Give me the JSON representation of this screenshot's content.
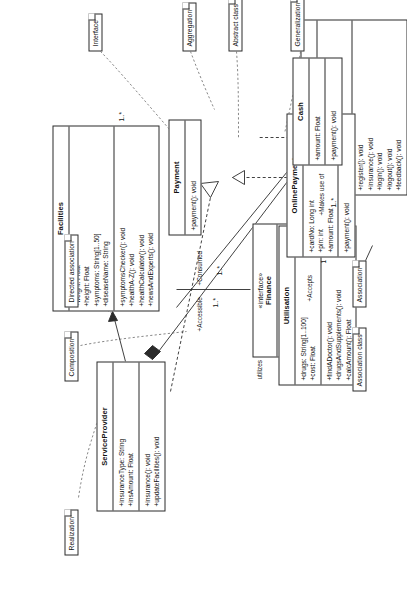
{
  "diagram": {
    "orientation": "rotated-90"
  },
  "classes": [
    {
      "id": "serviceprovider",
      "name": "ServiceProvider",
      "stereotype": "",
      "attributes": [
        "+insuranceType: String",
        "+insAmount: Float"
      ],
      "methods": [
        "+insurance(): void",
        "+updateFacilities(): void"
      ]
    },
    {
      "id": "facilities",
      "name": "Facilities",
      "stereotype": "",
      "attributes": [
        "+weight: Float",
        "+height: Float",
        "+symptoms: String[1..50]",
        "+diseaseName: String"
      ],
      "methods": [
        "+symptomsChecker(): void",
        "+healthA-Z(): void",
        "+healthCalculator(): void",
        "+newsAndExperts(): void"
      ]
    },
    {
      "id": "finance",
      "name": "Finance",
      "stereotype": "«interface»",
      "attributes": [],
      "methods": [
        "+insurance(): void"
      ]
    },
    {
      "id": "utilisation",
      "name": "Utilisation",
      "stereotype": "",
      "attributes": [
        "+drugs: String[1..100]",
        "+cost: Float"
      ],
      "methods": [
        "+findADoctor(): void",
        "+drugsAndSupplements(): void",
        "+calcAmount(): Float"
      ]
    },
    {
      "id": "user",
      "name": "User",
      "stereotype": "",
      "attributes": [
        "+name: String",
        "+id: int",
        "+password: String"
      ],
      "methods": [
        "+register(): void",
        "+insurance(): void",
        "+login(): void",
        "+logout(): void",
        "+feedback(): void"
      ]
    },
    {
      "id": "payment",
      "name": "Payment",
      "stereotype": "",
      "attributes": [],
      "methods": [
        "+payment(): void"
      ]
    },
    {
      "id": "onlinepayment",
      "name": "OnlinePayment",
      "stereotype": "",
      "attributes": [
        "+cardNo: Long int",
        "+pin: int",
        "+amount: Float"
      ],
      "methods": [
        "+payment(): void"
      ]
    },
    {
      "id": "cash",
      "name": "Cash",
      "stereotype": "",
      "attributes": [
        "+amount: Float"
      ],
      "methods": [
        "+payment(): void"
      ]
    }
  ],
  "notes": [
    {
      "id": "realization",
      "label": "Realization"
    },
    {
      "id": "composition",
      "label": "Composition"
    },
    {
      "id": "directed-association",
      "label": "Directed association"
    },
    {
      "id": "association",
      "label": "Association"
    },
    {
      "id": "association-class",
      "label": "Association class"
    },
    {
      "id": "interface",
      "label": "Interface"
    },
    {
      "id": "aggregation",
      "label": "Aggregation"
    },
    {
      "id": "abstract-class",
      "label": "Abstract class"
    },
    {
      "id": "generalization",
      "label": "Generalization"
    }
  ],
  "edge_labels": [
    {
      "id": "accessible",
      "label": "+Accessible"
    },
    {
      "id": "consumed",
      "label": "+Consumed"
    },
    {
      "id": "utilizes",
      "label": "utilizes"
    },
    {
      "id": "accepts",
      "label": "+Accepts"
    },
    {
      "id": "makes-use-of",
      "label": "+Makes use of"
    }
  ],
  "multiplicities": [
    {
      "id": "m-facilities-1",
      "label": "1..*"
    },
    {
      "id": "m-facilities-2",
      "label": "1..*"
    },
    {
      "id": "m-util-1",
      "label": "1..*"
    },
    {
      "id": "m-user-1",
      "label": "1..*"
    },
    {
      "id": "m-payment-1",
      "label": "1"
    }
  ],
  "colors": {
    "stroke": "#2b2b2b",
    "dashed": "#7a7a7a",
    "background": "#ffffff"
  }
}
